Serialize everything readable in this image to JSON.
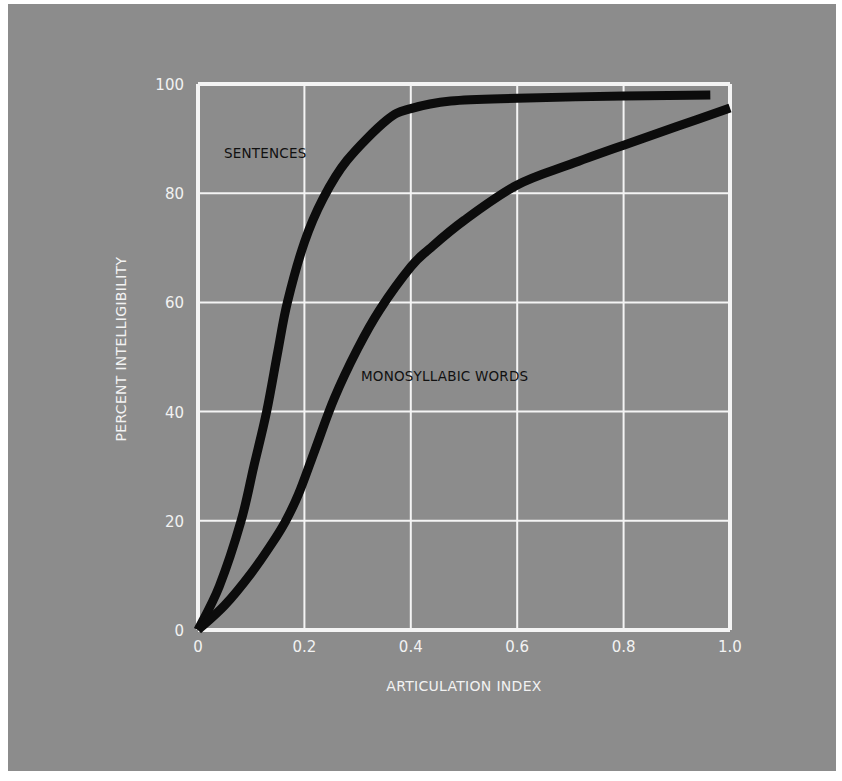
{
  "colors": {
    "background": "#8c8c8c",
    "grid": "#f4f4f4",
    "curve": "#0c0c0c",
    "tick_text": "#f2f2f2",
    "series_label_text": "#111111"
  },
  "chart_data": {
    "type": "line",
    "title": "",
    "xlabel": "ARTICULATION INDEX",
    "ylabel": "PERCENT INTELLIGIBILITY",
    "xlim": [
      0,
      1.0
    ],
    "ylim": [
      0,
      100
    ],
    "grid": true,
    "legend": "inline labels",
    "x_ticks": [
      "0",
      "0.2",
      "0.4",
      "0.6",
      "0.8",
      "1.0"
    ],
    "y_ticks": [
      "0",
      "20",
      "40",
      "60",
      "80",
      "100"
    ],
    "series": [
      {
        "name": "SENTENCES",
        "points": [
          [
            0,
            0
          ],
          [
            0.04,
            8
          ],
          [
            0.081,
            20
          ],
          [
            0.105,
            30
          ],
          [
            0.129,
            40
          ],
          [
            0.15,
            51
          ],
          [
            0.168,
            60
          ],
          [
            0.2,
            71
          ],
          [
            0.235,
            79
          ],
          [
            0.28,
            86
          ],
          [
            0.355,
            93.4
          ],
          [
            0.4,
            95.5
          ],
          [
            0.475,
            96.9
          ],
          [
            0.6,
            97.4
          ],
          [
            0.8,
            97.8
          ],
          [
            0.963,
            98
          ]
        ]
      },
      {
        "name": "MONOSYLLABIC WORDS",
        "points": [
          [
            0,
            0
          ],
          [
            0.05,
            4.5
          ],
          [
            0.1,
            10.4
          ],
          [
            0.14,
            16
          ],
          [
            0.165,
            20
          ],
          [
            0.189,
            24.9
          ],
          [
            0.22,
            33
          ],
          [
            0.256,
            42.4
          ],
          [
            0.3,
            51.5
          ],
          [
            0.342,
            58.7
          ],
          [
            0.4,
            66.5
          ],
          [
            0.435,
            69.8
          ],
          [
            0.5,
            75
          ],
          [
            0.6,
            81.5
          ],
          [
            0.7,
            85.3
          ],
          [
            0.8,
            88.8
          ],
          [
            0.9,
            92.2
          ],
          [
            1.0,
            95.6
          ]
        ]
      }
    ],
    "annotations": [
      {
        "text": "SENTENCES",
        "x": 0.05,
        "y": 87
      },
      {
        "text": "MONOSYLLABIC WORDS",
        "x": 0.306,
        "y": 45
      }
    ]
  }
}
